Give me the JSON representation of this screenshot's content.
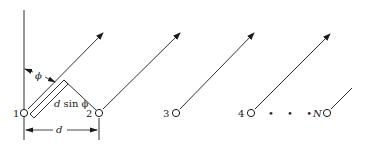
{
  "diagram": {
    "type": "linear antenna array geometry",
    "colors": {
      "stroke": "#1a1a1a",
      "background": "#ffffff"
    },
    "elements": [
      {
        "label": "1",
        "x": 24,
        "y": 113
      },
      {
        "label": "2",
        "x": 99,
        "y": 113
      },
      {
        "label": "3",
        "x": 176,
        "y": 113
      },
      {
        "label": "4",
        "x": 251,
        "y": 113
      },
      {
        "label": "N",
        "x": 327,
        "y": 113
      }
    ],
    "ellipsis": "• • •",
    "angle_label": "ϕ",
    "path_difference_label_d": "d",
    "path_difference_label_rest": " sin ϕ",
    "spacing_label": "d"
  }
}
